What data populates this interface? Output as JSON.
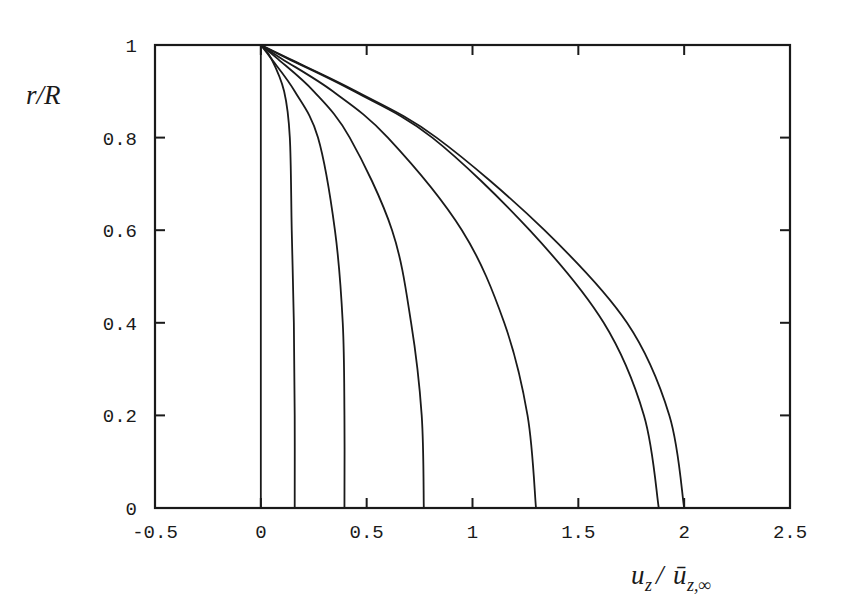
{
  "chart_data": {
    "type": "line",
    "title": "",
    "xlabel": "u_z / ū_{z,∞}",
    "ylabel": "r/R",
    "xlim": [
      -0.5,
      2.5
    ],
    "ylim": [
      0,
      1
    ],
    "grid": false,
    "legend": null,
    "x_ticks": [
      -0.5,
      0,
      0.5,
      1,
      1.5,
      2,
      2.5
    ],
    "x_tick_labels": [
      "-0.5",
      "0",
      "0.5",
      "1",
      "1.5",
      "2",
      "2.5"
    ],
    "y_ticks": [
      0,
      0.2,
      0.4,
      0.6,
      0.8,
      1
    ],
    "y_tick_labels": [
      "0",
      "0.2",
      "0.4",
      "0.6",
      "0.8",
      "1"
    ],
    "series": [
      {
        "name": "profile-1",
        "r": [
          0,
          0.2,
          0.4,
          0.6,
          0.8,
          0.9,
          1.0
        ],
        "u": [
          0,
          0,
          0,
          0,
          0,
          0,
          0
        ]
      },
      {
        "name": "profile-2",
        "r": [
          0,
          0.2,
          0.4,
          0.6,
          0.8,
          0.9,
          0.97,
          1.0
        ],
        "u": [
          0.16,
          0.16,
          0.156,
          0.146,
          0.137,
          0.11,
          0.05,
          0
        ]
      },
      {
        "name": "profile-3",
        "r": [
          0,
          0.2,
          0.4,
          0.6,
          0.8,
          0.9,
          0.97,
          1.0
        ],
        "u": [
          0.395,
          0.395,
          0.387,
          0.35,
          0.27,
          0.16,
          0.05,
          0
        ]
      },
      {
        "name": "profile-4",
        "r": [
          0,
          0.2,
          0.4,
          0.6,
          0.8,
          0.9,
          0.97,
          1.0
        ],
        "u": [
          0.77,
          0.76,
          0.71,
          0.62,
          0.42,
          0.25,
          0.08,
          0
        ]
      },
      {
        "name": "profile-5",
        "r": [
          0,
          0.2,
          0.4,
          0.6,
          0.8,
          0.9,
          0.97,
          1.0
        ],
        "u": [
          1.3,
          1.26,
          1.15,
          0.95,
          0.6,
          0.34,
          0.1,
          0
        ]
      },
      {
        "name": "profile-6",
        "r": [
          0,
          0.2,
          0.4,
          0.6,
          0.8,
          0.9,
          0.97,
          1.0
        ],
        "u": [
          1.88,
          1.81,
          1.62,
          1.27,
          0.81,
          0.44,
          0.13,
          0
        ]
      },
      {
        "name": "profile-7",
        "r": [
          0,
          0.2,
          0.4,
          0.6,
          0.8,
          0.9,
          0.97,
          1.0
        ],
        "u": [
          2.0,
          1.93,
          1.73,
          1.34,
          0.83,
          0.45,
          0.135,
          0
        ]
      }
    ]
  },
  "labels": {
    "ylabel_main": "r/R",
    "xlabel_u": "u",
    "xlabel_z1": "z",
    "xlabel_slash": "/",
    "xlabel_ubar": "ū",
    "xlabel_z2": "z,∞"
  },
  "style": {
    "line_color": "#1a1a1a",
    "background": "#ffffff"
  }
}
